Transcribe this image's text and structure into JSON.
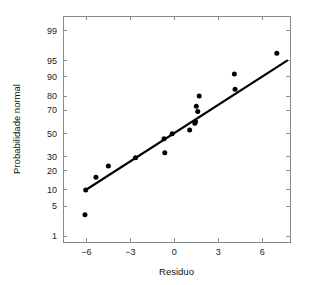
{
  "chart_data": {
    "type": "scatter",
    "title": "",
    "xlabel": "Residuo",
    "ylabel": "Probabilidade normal",
    "xlim": [
      -7.6,
      7.9
    ],
    "ylim": [
      0.7,
      99.6
    ],
    "grid": false,
    "legend": null,
    "y_scale": "normal-probability",
    "xticks": [
      -6,
      -3,
      0,
      3,
      6
    ],
    "xtick_labels": [
      "−6",
      "−3",
      "0",
      "3",
      "6"
    ],
    "yticks": [
      1,
      5,
      10,
      20,
      30,
      50,
      70,
      80,
      90,
      95,
      99
    ],
    "ytick_labels": [
      "1",
      "5",
      "10",
      "20",
      "30",
      "50",
      "70",
      "80",
      "90",
      "95",
      "99"
    ],
    "series": [
      {
        "name": "residuos",
        "marker": "filled-circle",
        "color": "#000000",
        "points": [
          {
            "x": -6.1,
            "y": 3.3
          },
          {
            "x": -6.05,
            "y": 10.0
          },
          {
            "x": -5.35,
            "y": 16.0
          },
          {
            "x": -4.5,
            "y": 23.0
          },
          {
            "x": -2.65,
            "y": 29.0
          },
          {
            "x": -0.7,
            "y": 45.0
          },
          {
            "x": -0.65,
            "y": 33.0
          },
          {
            "x": -0.15,
            "y": 49.5
          },
          {
            "x": 1.05,
            "y": 53.0
          },
          {
            "x": 1.4,
            "y": 59.0
          },
          {
            "x": 1.45,
            "y": 60.5
          },
          {
            "x": 1.5,
            "y": 73.0
          },
          {
            "x": 1.6,
            "y": 69.0
          },
          {
            "x": 1.7,
            "y": 80.0
          },
          {
            "x": 4.1,
            "y": 91.0
          },
          {
            "x": 4.15,
            "y": 84.0
          },
          {
            "x": 7.0,
            "y": 96.5
          }
        ]
      }
    ],
    "reference_line": {
      "name": "linha-de-referencia",
      "color": "#000000",
      "start": {
        "x": -6.05,
        "y": 10.0
      },
      "end": {
        "x": 7.7,
        "y": 95.0
      }
    }
  },
  "colors": {
    "background": "#ffffff",
    "axis": "#8a8a8a",
    "marker": "#000000",
    "line": "#000000",
    "text": "#111111"
  }
}
